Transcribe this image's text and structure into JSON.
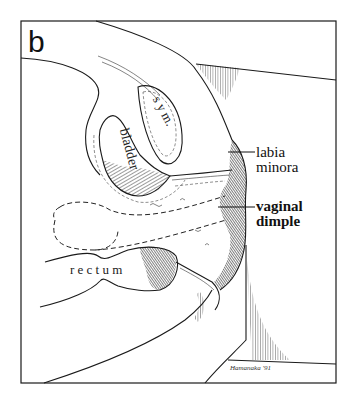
{
  "figure": {
    "panel_letter": "b",
    "labels": {
      "symphysis": "s y m.",
      "bladder": "bladder",
      "rectum": "r e c t u m"
    },
    "callouts": [
      {
        "line1": "labia",
        "line2": "minora",
        "bold": false
      },
      {
        "line1": "vaginal",
        "line2": "dimple",
        "bold": true
      }
    ],
    "signature": "Hamanaka '91",
    "colors": {
      "line": "#1a1a1a",
      "background": "#ffffff"
    }
  }
}
